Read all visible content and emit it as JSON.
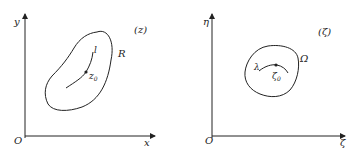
{
  "left_panel": {
    "plane_label": "(z)",
    "y_axis_label": "y",
    "x_axis_label": "x",
    "origin_label": "O",
    "region_label": "R",
    "curve_label": "l",
    "point_label": "z",
    "point_subscript": "0"
  },
  "right_panel": {
    "plane_label": "(ζ)",
    "y_axis_label": "η",
    "x_axis_label": "ζ",
    "origin_label": "O",
    "region_label": "Ω",
    "curve_label": "λ",
    "point_label": "ζ",
    "point_subscript": "0"
  },
  "colors": {
    "stroke": "#222222",
    "background": "#ffffff"
  }
}
